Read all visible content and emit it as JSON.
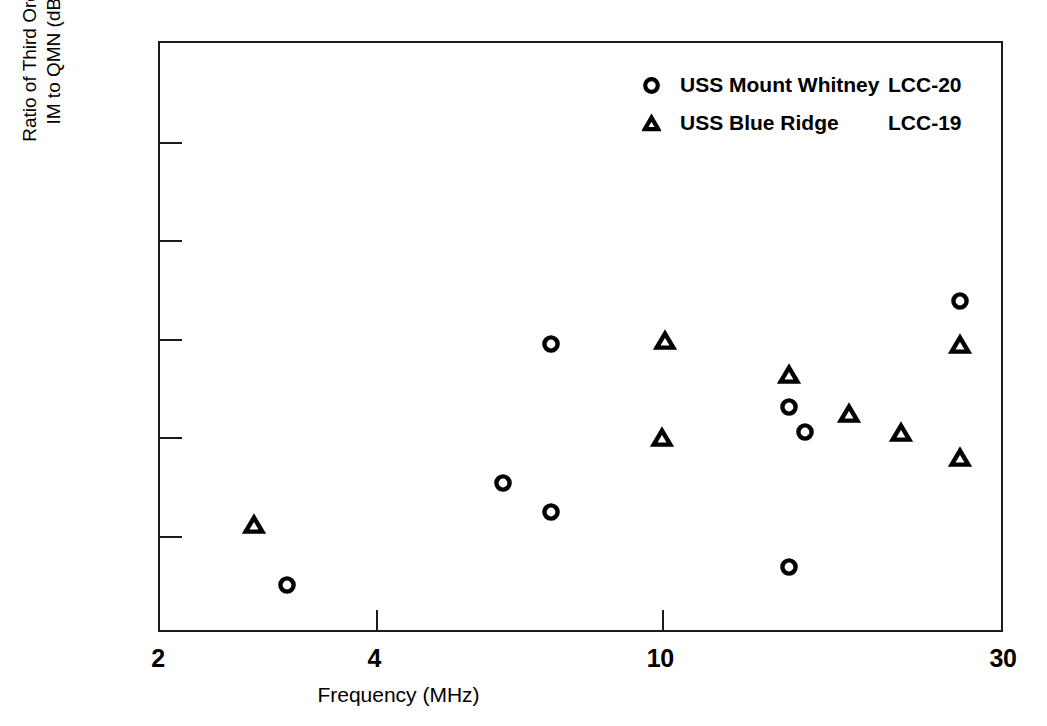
{
  "chart_data": {
    "type": "scatter",
    "title": "",
    "xlabel": "Frequency (MHz)",
    "ylabel": "Ratio of Third Order\nIM to QMN (dB)",
    "ylabel_lines": [
      "Ratio of Third Order",
      "IM to QMN (dB)"
    ],
    "xscale": "log",
    "yscale": "linear",
    "xlim": [
      2,
      30
    ],
    "ylim": [
      20,
      80
    ],
    "xticks": [
      2,
      4,
      10,
      30
    ],
    "xtick_labels": [
      "2",
      "4",
      "10",
      "30"
    ],
    "yticks": [
      20,
      30,
      40,
      50,
      60,
      70,
      80
    ],
    "ytick_labels": [
      "20",
      "30",
      "40",
      "50",
      "60",
      "70",
      "80"
    ],
    "grid": false,
    "legend_position": "upper right",
    "series": [
      {
        "name": "USS Mount Whitney",
        "hull": "LCC-20",
        "marker": "circle-open",
        "color": "#000000",
        "points": [
          {
            "x": 3.0,
            "y": 25.0
          },
          {
            "x": 6.0,
            "y": 35.3
          },
          {
            "x": 7.0,
            "y": 32.4
          },
          {
            "x": 7.0,
            "y": 49.4
          },
          {
            "x": 15.0,
            "y": 26.8
          },
          {
            "x": 15.0,
            "y": 43.0
          },
          {
            "x": 15.8,
            "y": 40.5
          },
          {
            "x": 26.0,
            "y": 53.8
          }
        ]
      },
      {
        "name": "USS Blue Ridge",
        "hull": "LCC-19",
        "marker": "triangle-open",
        "color": "#000000",
        "points": [
          {
            "x": 2.7,
            "y": 31.1
          },
          {
            "x": 10.0,
            "y": 39.9
          },
          {
            "x": 10.1,
            "y": 49.7
          },
          {
            "x": 15.0,
            "y": 46.3
          },
          {
            "x": 18.2,
            "y": 42.3
          },
          {
            "x": 21.5,
            "y": 40.4
          },
          {
            "x": 26.0,
            "y": 49.3
          },
          {
            "x": 26.0,
            "y": 37.9
          }
        ]
      }
    ]
  },
  "legend": {
    "entries": [
      {
        "name": "USS Mount Whitney",
        "hull": "LCC-20"
      },
      {
        "name": "USS Blue Ridge",
        "hull": "LCC-19"
      }
    ]
  }
}
